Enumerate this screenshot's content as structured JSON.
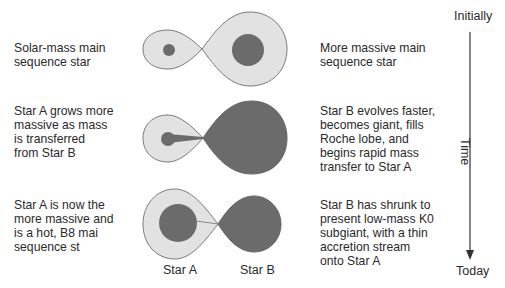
{
  "colors": {
    "lobe_fill": "#e2e2e2",
    "lobe_stroke": "#7a7a7a",
    "star_fill": "#6b6b6b",
    "text": "#2a2a2a"
  },
  "stages": [
    {
      "left_text": "Solar-mass main\nsequence star",
      "right_text": "More massive main\nsequence star"
    },
    {
      "left_text": "Star A grows more\nmassive as mass\nis transferred\nfrom Star B",
      "right_text": "Star B evolves faster,\nbecomes giant, fills\nRoche lobe, and\nbegins rapid mass\ntransfer to Star A"
    },
    {
      "left_text": "Star A is now the\nmore massive and\nis a hot, B8 mai\nsequence st",
      "right_text": "Star B has shrunk to\npresent low-mass K0\nsubgiant, with a thin\naccretion stream\nonto Star A"
    }
  ],
  "star_labels": {
    "a": "Star A",
    "b": "Star B"
  },
  "timeline": {
    "start": "Initially",
    "axis": "Time",
    "end": "Today"
  }
}
